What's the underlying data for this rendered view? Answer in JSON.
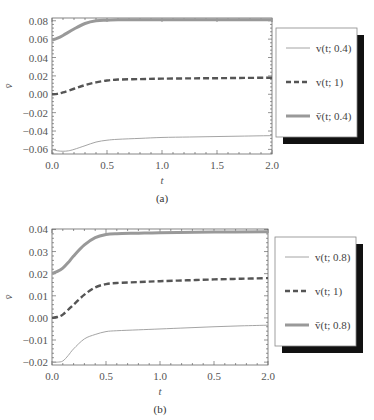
{
  "chart_data": [
    {
      "id": "a",
      "type": "line",
      "caption": "(a)",
      "title": "",
      "xlabel": "t",
      "ylabel": "v̄",
      "xlim": [
        0,
        2
      ],
      "ylim": [
        -0.065,
        0.083
      ],
      "x_ticks": [
        0.0,
        0.5,
        1.0,
        1.5,
        2.0
      ],
      "x_tick_labels": [
        "0.0",
        "0.5",
        "1.0",
        "1.5",
        "2.0"
      ],
      "y_ticks": [
        0.08,
        0.06,
        0.04,
        0.02,
        0.0,
        -0.02,
        -0.04,
        -0.06
      ],
      "y_tick_labels": [
        "0.08",
        "0.06",
        "0.04",
        "0.02",
        "0.00",
        "−0.02",
        "−0.04",
        "−0.06"
      ],
      "grid": false,
      "legend_position": "right",
      "series": [
        {
          "name": "v(t; 0.4)",
          "legend_label": "v(t; 0.4)",
          "style": "thin-solid",
          "color": "#9a9a9a",
          "x": [
            0.0,
            0.05,
            0.1,
            0.15,
            0.2,
            0.3,
            0.4,
            0.5,
            0.6,
            0.8,
            1.0,
            1.25,
            1.5,
            1.75,
            2.0
          ],
          "y": [
            -0.06,
            -0.0615,
            -0.062,
            -0.0615,
            -0.06,
            -0.056,
            -0.052,
            -0.05,
            -0.049,
            -0.048,
            -0.047,
            -0.0465,
            -0.046,
            -0.0455,
            -0.045
          ]
        },
        {
          "name": "v(t; 1)",
          "legend_label": "v(t; 1)",
          "style": "dashed",
          "color": "#555555",
          "x": [
            0.0,
            0.05,
            0.1,
            0.2,
            0.3,
            0.4,
            0.5,
            0.6,
            0.8,
            1.0,
            1.25,
            1.5,
            1.75,
            2.0
          ],
          "y": [
            0.0,
            0.0005,
            0.002,
            0.006,
            0.01,
            0.013,
            0.015,
            0.016,
            0.0165,
            0.017,
            0.0173,
            0.0175,
            0.0178,
            0.018
          ]
        },
        {
          "name": "v̄(t; 0.4)",
          "legend_label": "v̄(t; 0.4)",
          "style": "thick-solid",
          "color": "#999999",
          "x": [
            0.0,
            0.05,
            0.1,
            0.2,
            0.3,
            0.4,
            0.5,
            0.6,
            0.8,
            1.0,
            1.5,
            2.0
          ],
          "y": [
            0.059,
            0.061,
            0.064,
            0.071,
            0.077,
            0.08,
            0.0805,
            0.081,
            0.081,
            0.081,
            0.081,
            0.081
          ]
        }
      ]
    },
    {
      "id": "b",
      "type": "line",
      "caption": "(b)",
      "title": "",
      "xlabel": "t",
      "ylabel": "v̄",
      "xlim": [
        0,
        2
      ],
      "ylim": [
        -0.0213,
        0.0402
      ],
      "x_ticks": [
        0.0,
        0.5,
        1.0,
        1.5,
        2.0
      ],
      "x_tick_labels": [
        "0.0",
        "0.5",
        "1.0",
        "0.5",
        "2.0"
      ],
      "y_ticks": [
        0.04,
        0.03,
        0.02,
        0.01,
        0.0,
        -0.01,
        -0.02
      ],
      "y_tick_labels": [
        "0.04",
        "0.03",
        "0.02",
        "0.01",
        "0.00",
        "−0.01",
        "−0.02"
      ],
      "grid": false,
      "legend_position": "right",
      "series": [
        {
          "name": "v(t; 0.8)",
          "legend_label": "v(t; 0.8)",
          "style": "thin-solid",
          "color": "#9a9a9a",
          "x": [
            0.0,
            0.05,
            0.1,
            0.15,
            0.2,
            0.3,
            0.4,
            0.5,
            0.6,
            0.8,
            1.0,
            1.25,
            1.5,
            1.75,
            2.0
          ],
          "y": [
            -0.02,
            -0.02,
            -0.0195,
            -0.017,
            -0.014,
            -0.0095,
            -0.0075,
            -0.0062,
            -0.0058,
            -0.0054,
            -0.005,
            -0.0045,
            -0.004,
            -0.0036,
            -0.0033
          ]
        },
        {
          "name": "v(t; 1)",
          "legend_label": "v(t; 1)",
          "style": "dashed",
          "color": "#555555",
          "x": [
            0.0,
            0.05,
            0.1,
            0.2,
            0.3,
            0.4,
            0.5,
            0.6,
            0.8,
            1.0,
            1.25,
            1.5,
            1.75,
            2.0
          ],
          "y": [
            0.0,
            0.0004,
            0.0015,
            0.006,
            0.0105,
            0.0138,
            0.0153,
            0.0158,
            0.0162,
            0.0166,
            0.017,
            0.0174,
            0.0177,
            0.018
          ]
        },
        {
          "name": "v̄(t; 0.8)",
          "legend_label": "v̄(t; 0.8)",
          "style": "thick-solid",
          "color": "#999999",
          "x": [
            0.0,
            0.05,
            0.1,
            0.15,
            0.2,
            0.3,
            0.4,
            0.5,
            0.6,
            0.8,
            1.0,
            1.5,
            2.0
          ],
          "y": [
            0.02,
            0.021,
            0.0225,
            0.025,
            0.028,
            0.033,
            0.0363,
            0.0377,
            0.0381,
            0.0383,
            0.0385,
            0.0388,
            0.039
          ]
        }
      ]
    }
  ]
}
